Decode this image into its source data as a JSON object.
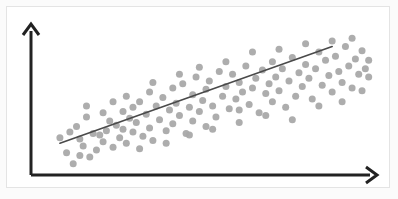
{
  "figure": {
    "title": "",
    "background_color": "#ffffff",
    "frame_color": "#e4e4e4",
    "axis_color": "#222222",
    "point_color": "#a9a9a9",
    "line_color": "#4a4a4a",
    "width": 398,
    "height": 199
  },
  "axes": {
    "x_axis_label": "",
    "y_axis_label": "",
    "origin": [
      31,
      175
    ],
    "x_axis_end": [
      377,
      175
    ],
    "y_axis_end": [
      31,
      24
    ],
    "x_arrowhead": "arrow-right",
    "y_arrowhead": "arrow-up",
    "grid": false,
    "tick_labels_x": [],
    "tick_labels_y": []
  },
  "chart_data": {
    "type": "scatter",
    "title": "",
    "subtitle": "",
    "xlabel": "",
    "ylabel": "",
    "xlim": [
      0,
      100
    ],
    "ylim": [
      0,
      100
    ],
    "grid": false,
    "legend": [],
    "legend_position": "none",
    "annotations": [],
    "marker": {
      "shape": "circle",
      "size_px": 7,
      "color": "#a9a9a9",
      "opacity": 0.95
    },
    "series": [
      {
        "name": "observations",
        "type": "scatter",
        "point_count": 126,
        "points": [
          [
            8,
            11
          ],
          [
            10,
            3
          ],
          [
            11,
            30
          ],
          [
            12,
            21
          ],
          [
            13,
            16
          ],
          [
            14,
            37
          ],
          [
            15,
            8
          ],
          [
            16,
            25
          ],
          [
            17,
            13
          ],
          [
            18,
            24
          ],
          [
            19,
            19
          ],
          [
            20,
            27
          ],
          [
            21,
            34
          ],
          [
            22,
            15
          ],
          [
            23,
            31
          ],
          [
            24,
            22
          ],
          [
            25,
            41
          ],
          [
            25,
            28
          ],
          [
            26,
            18
          ],
          [
            27,
            36
          ],
          [
            28,
            26
          ],
          [
            28,
            44
          ],
          [
            29,
            33
          ],
          [
            30,
            48
          ],
          [
            31,
            23
          ],
          [
            32,
            39
          ],
          [
            33,
            55
          ],
          [
            33,
            29
          ],
          [
            34,
            20
          ],
          [
            35,
            45
          ],
          [
            36,
            35
          ],
          [
            37,
            51
          ],
          [
            38,
            27
          ],
          [
            39,
            42
          ],
          [
            40,
            58
          ],
          [
            40,
            32
          ],
          [
            41,
            47
          ],
          [
            42,
            38
          ],
          [
            43,
            61
          ],
          [
            44,
            25
          ],
          [
            45,
            44
          ],
          [
            46,
            53
          ],
          [
            46,
            34
          ],
          [
            47,
            66
          ],
          [
            48,
            41
          ],
          [
            49,
            49
          ],
          [
            50,
            57
          ],
          [
            50,
            30
          ],
          [
            51,
            63
          ],
          [
            52,
            45
          ],
          [
            53,
            37
          ],
          [
            54,
            70
          ],
          [
            55,
            52
          ],
          [
            56,
            59
          ],
          [
            57,
            43
          ],
          [
            58,
            68
          ],
          [
            59,
            50
          ],
          [
            60,
            33
          ],
          [
            60,
            62
          ],
          [
            61,
            55
          ],
          [
            62,
            74
          ],
          [
            63,
            46
          ],
          [
            64,
            58
          ],
          [
            65,
            65
          ],
          [
            66,
            40
          ],
          [
            67,
            71
          ],
          [
            68,
            54
          ],
          [
            69,
            61
          ],
          [
            70,
            48
          ],
          [
            70,
            77
          ],
          [
            71,
            66
          ],
          [
            72,
            56
          ],
          [
            73,
            72
          ],
          [
            74,
            44
          ],
          [
            75,
            63
          ],
          [
            76,
            80
          ],
          [
            77,
            52
          ],
          [
            78,
            69
          ],
          [
            79,
            59
          ],
          [
            80,
            75
          ],
          [
            81,
            65
          ],
          [
            82,
            50
          ],
          [
            83,
            72
          ],
          [
            84,
            84
          ],
          [
            85,
            60
          ],
          [
            86,
            78
          ],
          [
            87,
            67
          ],
          [
            88,
            55
          ],
          [
            89,
            81
          ],
          [
            90,
            70
          ],
          [
            91,
            62
          ],
          [
            92,
            88
          ],
          [
            93,
            74
          ],
          [
            94,
            58
          ],
          [
            95,
            79
          ],
          [
            96,
            68
          ],
          [
            97,
            85
          ],
          [
            98,
            72
          ],
          [
            6,
            22
          ],
          [
            9,
            26
          ],
          [
            12,
            9
          ],
          [
            14,
            45
          ],
          [
            19,
            40
          ],
          [
            22,
            48
          ],
          [
            26,
            52
          ],
          [
            30,
            14
          ],
          [
            34,
            62
          ],
          [
            38,
            18
          ],
          [
            42,
            68
          ],
          [
            45,
            24
          ],
          [
            48,
            73
          ],
          [
            52,
            28
          ],
          [
            56,
            77
          ],
          [
            60,
            42
          ],
          [
            64,
            84
          ],
          [
            68,
            38
          ],
          [
            72,
            86
          ],
          [
            76,
            35
          ],
          [
            80,
            90
          ],
          [
            84,
            45
          ],
          [
            88,
            92
          ],
          [
            91,
            48
          ],
          [
            94,
            94
          ],
          [
            97,
            56
          ],
          [
            99,
            66
          ],
          [
            99,
            78
          ]
        ]
      },
      {
        "name": "trend-line",
        "type": "line",
        "fit": "linear regression",
        "x_range": [
          6,
          88
        ],
        "y_range": [
          18,
          88
        ],
        "start_point": [
          6,
          18
        ],
        "end_point": [
          88,
          88
        ],
        "color": "#4a4a4a",
        "width_px": 1.6
      }
    ]
  }
}
